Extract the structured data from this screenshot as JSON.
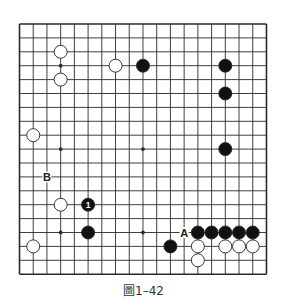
{
  "diagram": {
    "type": "go-board",
    "size": 19,
    "caption": "圖1–42",
    "colors": {
      "line": "#2a2a2a",
      "black_stone": "#111111",
      "white_stone": "#ffffff",
      "stone_stroke": "#222222",
      "background": "#ffffff"
    },
    "star_points": [
      [
        3,
        3
      ],
      [
        9,
        3
      ],
      [
        15,
        3
      ],
      [
        3,
        9
      ],
      [
        9,
        9
      ],
      [
        15,
        9
      ],
      [
        3,
        15
      ],
      [
        9,
        15
      ],
      [
        15,
        15
      ]
    ],
    "stones": [
      {
        "color": "white",
        "col": 3,
        "row": 2
      },
      {
        "color": "white",
        "col": 3,
        "row": 4
      },
      {
        "color": "white",
        "col": 7,
        "row": 3
      },
      {
        "color": "black",
        "col": 9,
        "row": 3
      },
      {
        "color": "black",
        "col": 15,
        "row": 3
      },
      {
        "color": "black",
        "col": 15,
        "row": 5
      },
      {
        "color": "white",
        "col": 1,
        "row": 8
      },
      {
        "color": "black",
        "col": 15,
        "row": 9
      },
      {
        "color": "white",
        "col": 3,
        "row": 13
      },
      {
        "color": "black",
        "col": 5,
        "row": 13,
        "label": "1"
      },
      {
        "color": "black",
        "col": 5,
        "row": 15
      },
      {
        "color": "white",
        "col": 1,
        "row": 16
      },
      {
        "color": "black",
        "col": 11,
        "row": 16
      },
      {
        "color": "black",
        "col": 13,
        "row": 15
      },
      {
        "color": "black",
        "col": 14,
        "row": 15
      },
      {
        "color": "black",
        "col": 15,
        "row": 15
      },
      {
        "color": "black",
        "col": 16,
        "row": 15
      },
      {
        "color": "black",
        "col": 17,
        "row": 15
      },
      {
        "color": "white",
        "col": 13,
        "row": 16
      },
      {
        "color": "white",
        "col": 15,
        "row": 16
      },
      {
        "color": "white",
        "col": 16,
        "row": 16
      },
      {
        "color": "white",
        "col": 17,
        "row": 16
      },
      {
        "color": "white",
        "col": 13,
        "row": 17
      }
    ],
    "markers": [
      {
        "text": "B",
        "col": 2,
        "row": 11
      },
      {
        "text": "A",
        "col": 12,
        "row": 15
      }
    ]
  }
}
